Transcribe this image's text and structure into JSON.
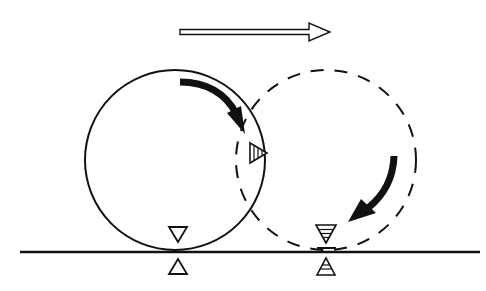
{
  "diagram": {
    "colors": {
      "stroke": "#111111",
      "background": "#ffffff",
      "fill": "#ffffff"
    },
    "direction_arrow": {
      "label": "direction of motion",
      "x1": 180,
      "x2": 330,
      "y": 32
    },
    "ground": {
      "label": "ground line",
      "x1": 20,
      "x2": 480,
      "y": 252
    },
    "wheel_start": {
      "label": "wheel initial position",
      "style": "solid",
      "cx": 175,
      "cy": 160,
      "r": 90
    },
    "wheel_end": {
      "label": "wheel rolled position",
      "style": "dashed",
      "cx": 326,
      "cy": 160,
      "r": 90
    },
    "markers": [
      {
        "id": "start-contact-on-wheel",
        "label": "contact marker on wheel (initial)",
        "pattern": "open",
        "direction": "down"
      },
      {
        "id": "start-contact-ground",
        "label": "contact marker on ground (initial)",
        "pattern": "open",
        "direction": "up"
      },
      {
        "id": "rotated-marker",
        "label": "marker rotated to side",
        "pattern": "hatched",
        "direction": "right"
      },
      {
        "id": "end-contact-on-wheel",
        "label": "new contact marker on wheel",
        "pattern": "hatched",
        "direction": "down"
      },
      {
        "id": "end-contact-ground",
        "label": "new contact marker on ground",
        "pattern": "hatched",
        "direction": "up"
      }
    ],
    "rotation_arrows": [
      {
        "id": "rotation-arrow-start",
        "label": "clockwise rotation (solid wheel)"
      },
      {
        "id": "rotation-arrow-end",
        "label": "clockwise rotation (dashed wheel)"
      }
    ]
  }
}
